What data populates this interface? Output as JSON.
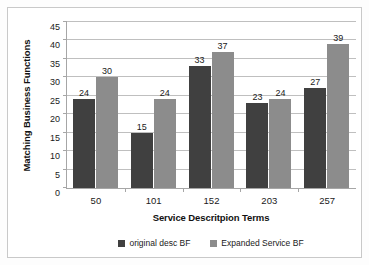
{
  "chart_data": {
    "type": "bar",
    "title": "",
    "subtitle": "",
    "xlabel": "Service Descritpion Terms",
    "ylabel": "Matching Business Functions",
    "categories": [
      "50",
      "101",
      "152",
      "203",
      "257"
    ],
    "series": [
      {
        "name": "original desc BF",
        "color": "#404040",
        "values": [
          24,
          15,
          33,
          23,
          27
        ]
      },
      {
        "name": "Expanded Service BF",
        "color": "#8c8c8c",
        "values": [
          30,
          24,
          37,
          24,
          39
        ]
      }
    ],
    "ylim": [
      0,
      45
    ],
    "ytick_step": 5,
    "yticks": [
      0,
      5,
      10,
      15,
      20,
      25,
      30,
      35,
      40,
      45
    ],
    "ytick_labels": [
      "0",
      "5",
      "10",
      "15",
      "20",
      "25",
      "30",
      "35",
      "40",
      "45"
    ],
    "grid": "horizontal",
    "legend_position": "bottom",
    "data_labels": true,
    "colors": {
      "series_dark": "#404040",
      "series_light": "#8c8c8c",
      "gridline": "#bfbfbf",
      "axis": "#a6a6a6",
      "frame": "#c9c9c9",
      "background": "#ffffff"
    }
  }
}
